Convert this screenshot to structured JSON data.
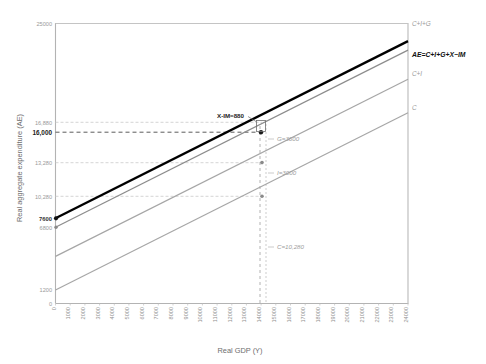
{
  "chart_data": {
    "type": "line",
    "title": "",
    "xlabel": "Real GDP (Y)",
    "ylabel": "Real aggregate expenditure (AE)",
    "xlim": [
      0,
      24000
    ],
    "ylim": [
      0,
      25000
    ],
    "grid": false,
    "legend_position": "right-end-labels",
    "x_ticks": [
      "0",
      "1000",
      "2000",
      "3000",
      "4000",
      "5000",
      "6000",
      "7000",
      "8000",
      "9000",
      "10000",
      "11000",
      "12000",
      "13000",
      "14000",
      "15000",
      "16000",
      "17000",
      "18000",
      "19000",
      "20000",
      "21000",
      "22000",
      "23000",
      "24000"
    ],
    "y_ticks": [
      {
        "value": 25000,
        "label": "25000",
        "style": "plain"
      },
      {
        "value": 16880,
        "label": "16,880",
        "style": "plain"
      },
      {
        "value": 16000,
        "label": "16,000",
        "style": "bold"
      },
      {
        "value": 13280,
        "label": "13,280",
        "style": "plain"
      },
      {
        "value": 10280,
        "label": "10,280",
        "style": "plain"
      },
      {
        "value": 7600,
        "label": "7600",
        "style": "dark"
      },
      {
        "value": 6800,
        "label": "6800",
        "style": "plain"
      },
      {
        "value": 1200,
        "label": "1200",
        "style": "plain"
      },
      {
        "value": 0,
        "label": "0",
        "style": "plain"
      }
    ],
    "series": [
      {
        "name": "C",
        "end_label": "C",
        "intercept": 1200,
        "slope": 0.64,
        "color": "#a6a6a6",
        "width": 1.1,
        "bold": false
      },
      {
        "name": "C+I",
        "end_label": "C+I",
        "intercept": 4200,
        "slope": 0.64,
        "color": "#a6a6a6",
        "width": 1.1,
        "bold": false
      },
      {
        "name": "C+I+G",
        "end_label": "C+I+G",
        "intercept": 6800,
        "slope": 0.64,
        "color": "#8c8c8c",
        "width": 1.1,
        "bold": false
      },
      {
        "name": "AE=C+I+G+X-IM",
        "end_label": "AE=C+I+G+X−IM",
        "intercept": 7600,
        "slope": 0.64,
        "color": "#000000",
        "width": 2.2,
        "bold": true
      }
    ],
    "equilibrium": {
      "x": 14000,
      "y": 16000
    },
    "annotations": [
      {
        "text": "X-IM=880",
        "component": "X-IM",
        "value": 880,
        "style": "dark"
      },
      {
        "text": "G=3600",
        "component": "G",
        "value": 3600,
        "style": "plain"
      },
      {
        "text": "I=3000",
        "component": "I",
        "value": 3000,
        "style": "plain"
      },
      {
        "text": "C=10,280",
        "component": "C",
        "value": 10280,
        "style": "plain"
      }
    ],
    "colors": {
      "axis": "#b3b3b3",
      "dashed_guide": "#9e9e9e",
      "dashed_guide_light": "#c9c9c9",
      "bold_line": "#000000",
      "grey_line": "#a6a6a6"
    }
  }
}
